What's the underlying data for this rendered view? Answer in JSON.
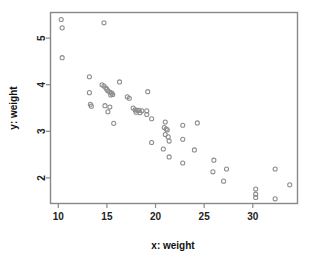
{
  "figure": {
    "background": "#ffffff",
    "frame_color": "#888888",
    "point_color": "#8d8d8d",
    "text_color": "#222222"
  },
  "chart_data": {
    "type": "scatter",
    "title": "",
    "xlabel": "x: weight",
    "ylabel": "y: weight",
    "xlim": [
      9.2,
      34.6
    ],
    "ylim": [
      1.45,
      5.55
    ],
    "xticks": [
      10,
      15,
      20,
      25,
      30
    ],
    "xticklabels": [
      "10",
      "15",
      "20",
      "25",
      "30"
    ],
    "yticks": [
      2,
      3,
      4,
      5
    ],
    "yticklabels": [
      "2",
      "3",
      "4",
      "5"
    ],
    "grid": false,
    "legend": null,
    "marker": "open-circle",
    "points": [
      [
        10.3,
        5.4
      ],
      [
        10.4,
        5.22
      ],
      [
        14.7,
        5.33
      ],
      [
        10.4,
        4.58
      ],
      [
        13.2,
        4.17
      ],
      [
        16.3,
        4.06
      ],
      [
        14.5,
        4.0
      ],
      [
        14.7,
        3.97
      ],
      [
        14.9,
        3.93
      ],
      [
        15.0,
        3.9
      ],
      [
        15.1,
        3.87
      ],
      [
        15.3,
        3.84
      ],
      [
        15.5,
        3.82
      ],
      [
        15.6,
        3.79
      ],
      [
        13.2,
        3.83
      ],
      [
        19.2,
        3.85
      ],
      [
        15.4,
        3.78
      ],
      [
        17.1,
        3.74
      ],
      [
        17.3,
        3.71
      ],
      [
        13.3,
        3.58
      ],
      [
        13.4,
        3.54
      ],
      [
        14.8,
        3.55
      ],
      [
        15.3,
        3.52
      ],
      [
        15.1,
        3.42
      ],
      [
        17.7,
        3.5
      ],
      [
        17.9,
        3.46
      ],
      [
        18.1,
        3.45
      ],
      [
        18.3,
        3.45
      ],
      [
        18.6,
        3.44
      ],
      [
        19.1,
        3.44
      ],
      [
        18.0,
        3.41
      ],
      [
        18.4,
        3.4
      ],
      [
        19.1,
        3.36
      ],
      [
        19.6,
        3.27
      ],
      [
        15.7,
        3.17
      ],
      [
        21.0,
        3.2
      ],
      [
        22.8,
        3.13
      ],
      [
        24.3,
        3.18
      ],
      [
        20.9,
        3.08
      ],
      [
        21.1,
        3.05
      ],
      [
        21.2,
        3.03
      ],
      [
        21.0,
        2.93
      ],
      [
        21.3,
        2.88
      ],
      [
        21.4,
        2.79
      ],
      [
        19.6,
        2.76
      ],
      [
        22.8,
        2.83
      ],
      [
        20.8,
        2.62
      ],
      [
        24.0,
        2.6
      ],
      [
        21.4,
        2.45
      ],
      [
        26.0,
        2.38
      ],
      [
        22.8,
        2.32
      ],
      [
        27.3,
        2.19
      ],
      [
        32.3,
        2.19
      ],
      [
        25.9,
        2.13
      ],
      [
        27.0,
        1.93
      ],
      [
        33.8,
        1.85
      ],
      [
        30.3,
        1.76
      ],
      [
        30.3,
        1.65
      ],
      [
        30.3,
        1.58
      ],
      [
        32.3,
        1.55
      ]
    ]
  }
}
